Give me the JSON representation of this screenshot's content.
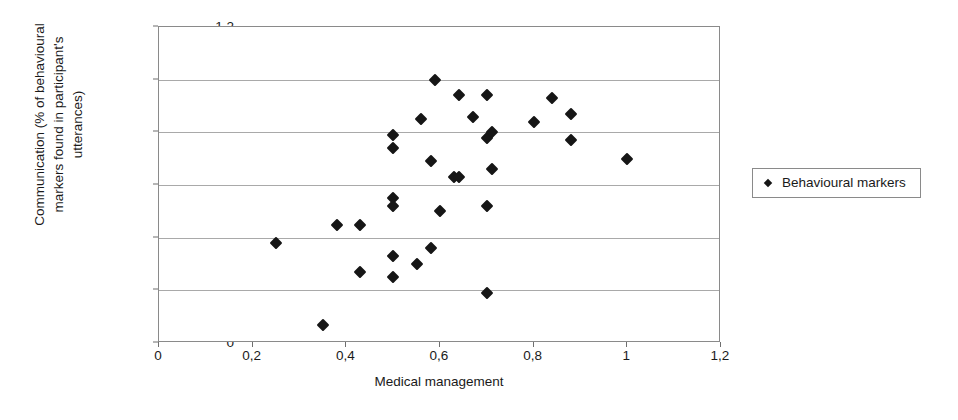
{
  "chart_data": {
    "type": "scatter",
    "title": "",
    "xlabel": "Medical management",
    "ylabel": "Communication (% of behavioural markers found in participant's utterances)",
    "ylabel_lines": [
      "Communication (% of behavioural",
      "markers found in participant's",
      "utterances)"
    ],
    "xlim": [
      0,
      1.2
    ],
    "ylim": [
      0,
      1.2
    ],
    "xticks": [
      0,
      0.2,
      0.4,
      0.6,
      0.8,
      1,
      1.2
    ],
    "yticks": [
      0,
      0.2,
      0.4,
      0.6,
      0.8,
      1,
      1.2
    ],
    "xtick_labels": [
      "0",
      "0,2",
      "0,4",
      "0,6",
      "0,8",
      "1",
      "1,2"
    ],
    "ytick_labels": [
      "0",
      "0,2",
      "0,4",
      "0,6",
      "0,8",
      "1",
      "1,2"
    ],
    "decimal_separator": ",",
    "grid": "horizontal",
    "legend_position": "right-outside",
    "marker": "diamond",
    "marker_color": "#161616",
    "frame_color": "#8a8a8a",
    "gridline_color": "#a9a9a9",
    "series": [
      {
        "name": "Behavioural markers",
        "points": [
          [
            0.25,
            0.38
          ],
          [
            0.35,
            0.07
          ],
          [
            0.38,
            0.45
          ],
          [
            0.43,
            0.45
          ],
          [
            0.43,
            0.27
          ],
          [
            0.5,
            0.55
          ],
          [
            0.5,
            0.52
          ],
          [
            0.5,
            0.33
          ],
          [
            0.5,
            0.25
          ],
          [
            0.5,
            0.79
          ],
          [
            0.5,
            0.74
          ],
          [
            0.55,
            0.3
          ],
          [
            0.56,
            0.85
          ],
          [
            0.58,
            0.69
          ],
          [
            0.58,
            0.36
          ],
          [
            0.59,
            1.0
          ],
          [
            0.6,
            0.5
          ],
          [
            0.63,
            0.63
          ],
          [
            0.64,
            0.94
          ],
          [
            0.64,
            0.63
          ],
          [
            0.67,
            0.86
          ],
          [
            0.7,
            0.94
          ],
          [
            0.7,
            0.78
          ],
          [
            0.7,
            0.52
          ],
          [
            0.7,
            0.19
          ],
          [
            0.71,
            0.66
          ],
          [
            0.71,
            0.8
          ],
          [
            0.8,
            0.84
          ],
          [
            0.84,
            0.93
          ],
          [
            0.88,
            0.87
          ],
          [
            0.88,
            0.77
          ],
          [
            1.0,
            0.7
          ]
        ]
      }
    ]
  },
  "legend": {
    "entries": [
      {
        "label": "Behavioural markers",
        "marker": "diamond-marker"
      }
    ]
  }
}
